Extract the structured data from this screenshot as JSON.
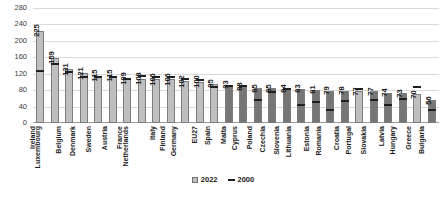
{
  "chart_data": {
    "type": "bar",
    "title": "",
    "subtitle": "",
    "xlabel": "",
    "ylabel": "",
    "ylim": [
      0,
      280
    ],
    "ytick_step": 40,
    "yticks": [
      280,
      240,
      200,
      160,
      120,
      80,
      40,
      0
    ],
    "grid": true,
    "legend_position": "bottom",
    "categories": [
      "Ireland",
      "Luxembourg",
      "Belgium",
      "Denmark",
      "Sweden",
      "Austria",
      "France",
      "Netherlands",
      "Italy",
      "Finland",
      "Germany",
      "EU27",
      "Spain",
      "Malta",
      "Cyprus",
      "Poland",
      "Czechia",
      "Slovenia",
      "Lithuania",
      "Estonia",
      "Romania",
      "Croatia",
      "Portugal",
      "Slovakia",
      "Latvia",
      "Hungary",
      "Greece",
      "Bulgaria"
    ],
    "series": [
      {
        "name": "2022",
        "marker": "square",
        "values": [
          225,
          159,
          131,
          121,
          115,
          115,
          109,
          108,
          106,
          106,
          102,
          100,
          95,
          93,
          88,
          85,
          85,
          84,
          83,
          81,
          79,
          78,
          77,
          77,
          74,
          73,
          70,
          56
        ]
      },
      {
        "name": "2000",
        "marker": "dash",
        "values": [
          122,
          138,
          120,
          107,
          107,
          108,
          103,
          109,
          108,
          106,
          103,
          100,
          82,
          85,
          86,
          50,
          71,
          77,
          39,
          46,
          26,
          49,
          79,
          52,
          38,
          53,
          83,
          28
        ]
      }
    ],
    "bar_shades": [
      "light",
      "light",
      "light",
      "light",
      "light",
      "light",
      "light",
      "light",
      "light",
      "light",
      "light",
      "light",
      "light",
      "dark",
      "dark",
      "dark",
      "dark",
      "dark",
      "dark",
      "dark",
      "dark",
      "dark",
      "light",
      "dark",
      "dark",
      "dark",
      "light",
      "dark"
    ],
    "colors": {
      "bar_light": "#bfbfbf",
      "bar_dark": "#767676",
      "bar_border": "#7d7d7d",
      "marker_2000": "#1f1f1f",
      "gridline": "#d9d9d9",
      "text": "#1a1a1a"
    }
  },
  "legend": {
    "entries": [
      {
        "label": "2022"
      },
      {
        "label": "2000"
      }
    ]
  }
}
